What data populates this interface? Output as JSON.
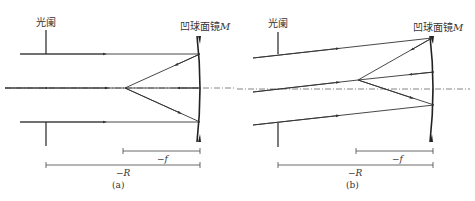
{
  "header_fragment": "…规。",
  "panel_a": {
    "stop_label": "光阑",
    "mirror_label": "凹球面镜",
    "mirror_symbol": "M",
    "focal_label": "−f",
    "radius_label": "−R",
    "caption": "(a)"
  },
  "panel_b": {
    "stop_label": "光阑",
    "mirror_label": "凹球面镜",
    "mirror_symbol": "M",
    "focal_label": "−f",
    "radius_label": "−R",
    "caption": "(b)"
  },
  "colors": {
    "line": "#333333",
    "axis": "#555555",
    "text": "#333333"
  }
}
